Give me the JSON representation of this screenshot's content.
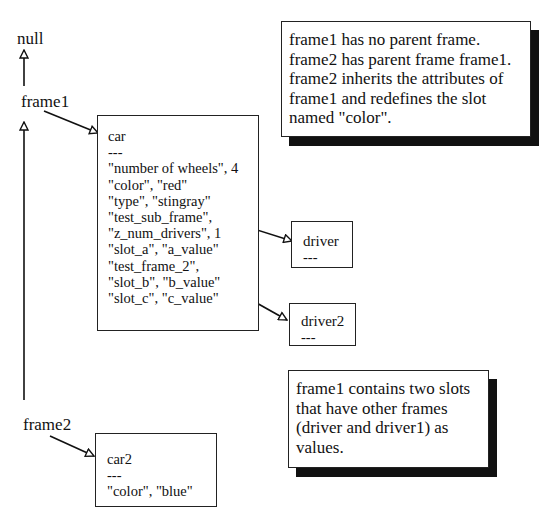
{
  "labels": {
    "null": "null",
    "frame1": "frame1",
    "frame2": "frame2"
  },
  "frames": {
    "car": {
      "title": "car",
      "separator": "---",
      "slots": [
        "\"number of wheels\", 4",
        "\"color\", \"red\"",
        "\"type\", \"stingray\"",
        "\"test_sub_frame\",",
        "\"z_num_drivers\", 1",
        "\"slot_a\", \"a_value\"",
        "\"test_frame_2\",",
        "\"slot_b\", \"b_value\"",
        "\"slot_c\", \"c_value\""
      ]
    },
    "driver": {
      "title": "driver",
      "separator": "---"
    },
    "driver2": {
      "title": "driver2",
      "separator": "---"
    },
    "car2": {
      "title": "car2",
      "separator": "---",
      "slots": [
        "\"color\", \"blue\""
      ]
    }
  },
  "callouts": {
    "inheritance": {
      "lines": [
        "frame1 has no parent frame.",
        "frame2 has parent frame frame1.",
        "frame2 inherits the attributes of",
        "frame1 and redefines the slot",
        "named \"color\"."
      ]
    },
    "subframes": {
      "lines": [
        "frame1 contains two slots",
        "that have other frames",
        "(driver and driver1) as",
        "values."
      ]
    }
  },
  "colors": {
    "line": "#111111",
    "background": "#ffffff",
    "shadow": "#111111"
  }
}
